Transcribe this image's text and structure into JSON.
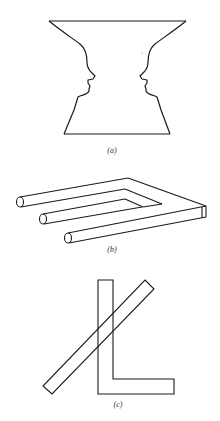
{
  "figures": [
    {
      "id": "a",
      "label": "(a)",
      "description": "Rubin vase / faces illusion: two facing profiles forming a vase outline"
    },
    {
      "id": "b",
      "label": "(b)",
      "description": "Impossible trident (blivet): three cylindrical prongs merging into two rectangular prongs"
    },
    {
      "id": "c",
      "label": "(c)",
      "description": "Overlapping L-shape and diagonal bar figure"
    }
  ],
  "colors": {
    "stroke": "#1a1a1a",
    "background": "#ffffff",
    "label": "#333333"
  }
}
